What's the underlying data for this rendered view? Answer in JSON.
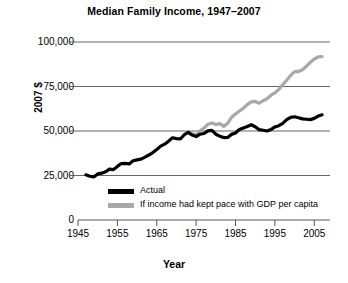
{
  "chart_data": {
    "type": "line",
    "title": "Median Family Income, 1947–2007",
    "xlabel": "Year",
    "ylabel": "2007 $",
    "xlim": [
      1945,
      2009
    ],
    "ylim": [
      0,
      100000
    ],
    "grid": "horizontal",
    "legend_position": "inside-bottom-left",
    "yticks": [
      "0",
      "25,000",
      "50,000",
      "75,000",
      "100,000"
    ],
    "ytick_values": [
      0,
      25000,
      50000,
      75000,
      100000
    ],
    "xticks": [
      "1945",
      "1955",
      "1965",
      "1975",
      "1985",
      "1995",
      "2005"
    ],
    "xtick_values": [
      1945,
      1955,
      1965,
      1975,
      1985,
      1995,
      2005
    ],
    "colors": {
      "actual": "#000000",
      "gdp_pace": "#a8a8a8",
      "gridline": "#555555",
      "axis": "#555555",
      "background": "#ffffff"
    },
    "series": [
      {
        "name": "Actual",
        "color": "#000000",
        "x": [
          1947,
          1948,
          1949,
          1950,
          1951,
          1952,
          1953,
          1954,
          1955,
          1956,
          1957,
          1958,
          1959,
          1960,
          1961,
          1962,
          1963,
          1964,
          1965,
          1966,
          1967,
          1968,
          1969,
          1970,
          1971,
          1972,
          1973,
          1974,
          1975,
          1976,
          1977,
          1978,
          1979,
          1980,
          1981,
          1982,
          1983,
          1984,
          1985,
          1986,
          1987,
          1988,
          1989,
          1990,
          1991,
          1992,
          1993,
          1994,
          1995,
          1996,
          1997,
          1998,
          1999,
          2000,
          2001,
          2002,
          2003,
          2004,
          2005,
          2006,
          2007
        ],
        "values": [
          25400,
          24600,
          24200,
          25900,
          26300,
          27100,
          28600,
          28300,
          30100,
          31700,
          31800,
          31500,
          33300,
          33800,
          34200,
          35300,
          36500,
          37900,
          39600,
          41500,
          42600,
          44300,
          46200,
          45700,
          45600,
          47900,
          49200,
          47700,
          46900,
          48200,
          48600,
          50100,
          50400,
          48200,
          47100,
          46300,
          46400,
          48100,
          48900,
          50900,
          51700,
          52500,
          53500,
          52400,
          50800,
          50400,
          50000,
          50800,
          52300,
          53000,
          54300,
          56400,
          57700,
          58000,
          57400,
          56800,
          56600,
          56400,
          57100,
          58400,
          59100
        ]
      },
      {
        "name": "If income had kept pace with GDP per capita",
        "color": "#a8a8a8",
        "x": [
          1973,
          1974,
          1975,
          1976,
          1977,
          1978,
          1979,
          1980,
          1981,
          1982,
          1983,
          1984,
          1985,
          1986,
          1987,
          1988,
          1989,
          1990,
          1991,
          1992,
          1993,
          1994,
          1995,
          1996,
          1997,
          1998,
          1999,
          2000,
          2001,
          2002,
          2003,
          2004,
          2005,
          2006,
          2007
        ],
        "values": [
          49200,
          48400,
          48000,
          50100,
          51600,
          53800,
          54500,
          53600,
          54200,
          52600,
          54300,
          57700,
          59500,
          61200,
          62800,
          64800,
          66400,
          66600,
          65600,
          67000,
          68100,
          70100,
          71400,
          73400,
          76000,
          78500,
          81200,
          83400,
          83400,
          84400,
          86400,
          88600,
          90400,
          91700,
          91800
        ]
      }
    ]
  },
  "legend": {
    "items": [
      {
        "label": "Actual",
        "color": "#000000"
      },
      {
        "label": "If income had kept pace with GDP per capita",
        "color": "#a8a8a8"
      }
    ]
  }
}
